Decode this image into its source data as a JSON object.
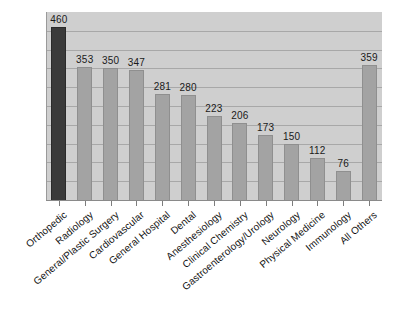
{
  "chart_data": {
    "type": "bar",
    "title": "",
    "subtitle": "",
    "xlabel": "",
    "ylabel": "",
    "ylim": [
      0,
      500
    ],
    "grid": true,
    "gridline_values": [
      50,
      100,
      150,
      200,
      250,
      300,
      350,
      400,
      450
    ],
    "legend": "none",
    "categories": [
      "Orthopedic",
      "Radiology",
      "General/Plastic Surgery",
      "Cardiovascular",
      "General Hospital",
      "Dental",
      "Anesthesiology",
      "Clinical Chemistry",
      "Gastroenterology/Urology",
      "Neurology",
      "Physical Medicine",
      "Immunology",
      "All Others"
    ],
    "values": [
      460,
      353,
      350,
      347,
      281,
      280,
      223,
      206,
      173,
      150,
      112,
      76,
      359
    ],
    "value_labels": [
      "460",
      "353",
      "350",
      "347",
      "281",
      "280",
      "223",
      "206",
      "173",
      "150",
      "112",
      "76",
      "359"
    ],
    "bar_colors": [
      "#3a3a3a",
      "#a3a3a3",
      "#a3a3a3",
      "#a3a3a3",
      "#a3a3a3",
      "#a3a3a3",
      "#a3a3a3",
      "#a3a3a3",
      "#a3a3a3",
      "#a3a3a3",
      "#a3a3a3",
      "#a3a3a3",
      "#a3a3a3"
    ],
    "highlight_index": 0,
    "plot_background": "#cfcfcf",
    "gridline_color": "#a8a8a8",
    "page_background": "#ffffff"
  }
}
